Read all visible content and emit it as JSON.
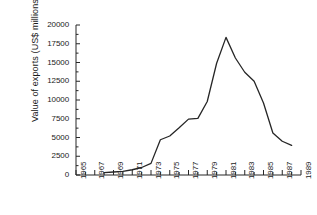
{
  "chart_data": {
    "type": "line",
    "title": "",
    "subtitle": "",
    "xlabel": "",
    "ylabel": "Value of exports (US$ millions)",
    "xlim": [
      1965,
      1989
    ],
    "ylim": [
      0,
      20000
    ],
    "grid": false,
    "legend": null,
    "x_tick_labels": [
      "1965",
      "1967",
      "1969",
      "1971",
      "1973",
      "1975",
      "1977",
      "1979",
      "1981",
      "1983",
      "1985",
      "1987",
      "1989"
    ],
    "x_tick_values": [
      1965,
      1967,
      1969,
      1971,
      1973,
      1975,
      1977,
      1979,
      1981,
      1983,
      1985,
      1987,
      1989
    ],
    "x_minor_tick_values": [
      1966,
      1968,
      1970,
      1972,
      1974,
      1976,
      1978,
      1980,
      1982,
      1984,
      1986,
      1988
    ],
    "y_tick_labels": [
      "0",
      "2500",
      "5000",
      "7500",
      "10000",
      "12500",
      "15000",
      "17500",
      "20000"
    ],
    "y_tick_values": [
      0,
      2500,
      5000,
      7500,
      10000,
      12500,
      15000,
      17500,
      20000
    ],
    "series": [
      {
        "name": "Value of exports",
        "color": "#262626",
        "x": [
          1968,
          1969,
          1970,
          1971,
          1972,
          1973,
          1974,
          1975,
          1976,
          1977,
          1978,
          1979,
          1980,
          1981,
          1982,
          1983,
          1984,
          1985,
          1986,
          1987,
          1988
        ],
        "values": [
          320,
          400,
          480,
          700,
          1000,
          1550,
          4700,
          5200,
          6300,
          7450,
          7550,
          9800,
          14900,
          18350,
          15600,
          13700,
          12500,
          9600,
          5600,
          4500,
          3950
        ]
      }
    ]
  },
  "axis": {
    "ylabel": "Value of exports (US$ millions)"
  }
}
